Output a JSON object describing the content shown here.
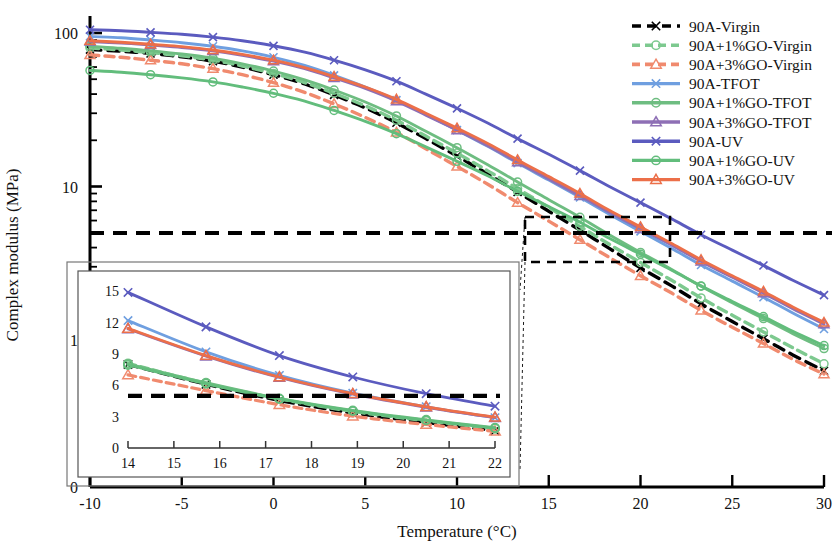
{
  "figure": {
    "title": "",
    "xlabel": "Temperature (°C)",
    "ylabel": "Complex modulus (MPa)"
  },
  "axes": {
    "x_ticks": [
      "-10",
      "-5",
      "0",
      "5",
      "10",
      "15",
      "20",
      "25",
      "30"
    ],
    "y_ticks": [
      "100",
      "10",
      "1",
      "0"
    ],
    "y_scale": "log",
    "x_range": [
      -10,
      30
    ],
    "y_range": [
      0.45,
      200
    ]
  },
  "reference_line": {
    "label": "5 MPa",
    "value": 5
  },
  "inset": {
    "x_ticks": [
      "14",
      "15",
      "16",
      "17",
      "18",
      "19",
      "20",
      "21",
      "22"
    ],
    "y_ticks": [
      "0",
      "3",
      "6",
      "9",
      "12",
      "15"
    ],
    "x_range": [
      14,
      22
    ],
    "y_range": [
      0,
      15.8
    ],
    "reference_value": 5
  },
  "legend": {
    "items": [
      {
        "label": "90A-Virgin",
        "color": "#000000",
        "dash": true,
        "marker": "x"
      },
      {
        "label": "90A+1%GO-Virgin",
        "color": "#7dc98f",
        "dash": true,
        "marker": "o"
      },
      {
        "label": "90A+3%GO-Virgin",
        "color": "#f08a6e",
        "dash": true,
        "marker": "t"
      },
      {
        "label": "90A-TFOT",
        "color": "#6f9fe0",
        "dash": false,
        "marker": "x"
      },
      {
        "label": "90A+1%GO-TFOT",
        "color": "#6ebd81",
        "dash": false,
        "marker": "o"
      },
      {
        "label": "90A+3%GO-TFOT",
        "color": "#8e6fb5",
        "dash": false,
        "marker": "t"
      },
      {
        "label": "90A-UV",
        "color": "#5b5bbf",
        "dash": false,
        "marker": "x"
      },
      {
        "label": "90A+1%GO-UV",
        "color": "#62bd7c",
        "dash": false,
        "marker": "o"
      },
      {
        "label": "90A+3%GO-UV",
        "color": "#ec6f49",
        "dash": false,
        "marker": "t"
      }
    ]
  },
  "chart_data": {
    "type": "line",
    "title": "",
    "xlabel": "Temperature (°C)",
    "ylabel": "Complex modulus (MPa)",
    "yscale": "log",
    "xlim": [
      -10,
      30
    ],
    "ylim": [
      0.45,
      200
    ],
    "grid": false,
    "legend_position": "top-right",
    "annotations": [
      {
        "text": "horizontal reference line at 5 MPa",
        "y": 5
      },
      {
        "text": "inset zoom of region 14-22 °C"
      }
    ],
    "x": [
      -10,
      -8.3,
      -6.7,
      -5,
      -3.3,
      -1.7,
      0,
      1.7,
      3.3,
      5,
      6.7,
      8.3,
      10,
      11.7,
      13.3,
      15,
      16.7,
      18.3,
      20,
      21.7,
      23.3,
      25,
      26.7,
      28.3,
      30
    ],
    "series": [
      {
        "name": "90A-Virgin",
        "color": "#000000",
        "style": "dashed",
        "marker": "x",
        "values": [
          78,
          76,
          73.5,
          70,
          65.5,
          60,
          53.5,
          46.5,
          39.5,
          32.5,
          26,
          20.5,
          15.8,
          12.0,
          9.2,
          6.9,
          5.2,
          3.95,
          2.95,
          2.25,
          1.72,
          1.32,
          1.02,
          0.8,
          0.63
        ]
      },
      {
        "name": "90A+1%GO-Virgin",
        "color": "#7dc98f",
        "style": "dashed",
        "marker": "o",
        "values": [
          80,
          77.5,
          74.5,
          71,
          66.5,
          61,
          54.5,
          47.5,
          40.5,
          33.5,
          27,
          21.3,
          16.5,
          12.6,
          9.7,
          7.3,
          5.5,
          4.2,
          3.2,
          2.45,
          1.88,
          1.45,
          1.13,
          0.89,
          0.7
        ]
      },
      {
        "name": "90A+3%GO-Virgin",
        "color": "#f08a6e",
        "style": "dashed",
        "marker": "t",
        "values": [
          72,
          69.5,
          66.5,
          63,
          58.5,
          53.5,
          47.5,
          41,
          34.5,
          28.2,
          22.5,
          17.6,
          13.5,
          10.3,
          7.85,
          5.95,
          4.5,
          3.45,
          2.62,
          2.02,
          1.56,
          1.21,
          0.95,
          0.75,
          0.6
        ]
      },
      {
        "name": "90A-TFOT",
        "color": "#6f9fe0",
        "style": "solid",
        "marker": "x",
        "values": [
          95,
          93,
          90,
          86.5,
          82,
          76.5,
          69.5,
          61.5,
          53,
          44.5,
          36.5,
          29.5,
          23.3,
          18.2,
          14.2,
          11.0,
          8.5,
          6.6,
          5.1,
          3.95,
          3.08,
          2.42,
          1.9,
          1.5,
          1.18
        ]
      },
      {
        "name": "90A+1%GO-TFOT",
        "color": "#6ebd81",
        "style": "solid",
        "marker": "o",
        "values": [
          82,
          79.5,
          76.5,
          73,
          68.5,
          63,
          56.5,
          49.5,
          42.5,
          35.5,
          28.8,
          22.9,
          17.9,
          13.8,
          10.7,
          8.2,
          6.3,
          4.85,
          3.72,
          2.88,
          2.24,
          1.75,
          1.38,
          1.1,
          0.88
        ]
      },
      {
        "name": "90A+3%GO-TFOT",
        "color": "#8e6fb5",
        "style": "solid",
        "marker": "t",
        "values": [
          88,
          86,
          83.5,
          80.5,
          76.5,
          71.5,
          65.5,
          58.5,
          51,
          43.5,
          36.0,
          29.2,
          23.3,
          18.4,
          14.4,
          11.2,
          8.7,
          6.8,
          5.3,
          4.15,
          3.25,
          2.56,
          2.02,
          1.6,
          1.27
        ]
      },
      {
        "name": "90A-UV",
        "color": "#5b5bbf",
        "style": "solid",
        "marker": "x",
        "values": [
          105,
          103.5,
          101,
          98,
          94,
          89,
          82.5,
          75,
          66.5,
          57.5,
          48.5,
          40.0,
          32.3,
          25.8,
          20.5,
          16.2,
          12.7,
          10.0,
          7.85,
          6.15,
          4.85,
          3.85,
          3.06,
          2.45,
          1.96
        ]
      },
      {
        "name": "90A+1%GO-UV",
        "color": "#62bd7c",
        "style": "solid",
        "marker": "o",
        "values": [
          57,
          55.5,
          53.5,
          51,
          48,
          44.5,
          40.5,
          36.0,
          31.3,
          26.6,
          22.1,
          18.1,
          14.6,
          11.7,
          9.3,
          7.4,
          5.85,
          4.6,
          3.62,
          2.85,
          2.25,
          1.78,
          1.42,
          1.14,
          0.92
        ]
      },
      {
        "name": "90A+3%GO-UV",
        "color": "#ec6f49",
        "style": "solid",
        "marker": "t",
        "values": [
          89,
          87,
          84.5,
          81.5,
          77.5,
          72.5,
          66.5,
          59.5,
          52,
          44.5,
          37.0,
          30.0,
          24.0,
          19.0,
          14.9,
          11.6,
          9.0,
          7.0,
          5.45,
          4.25,
          3.33,
          2.62,
          2.07,
          1.64,
          1.3
        ]
      }
    ],
    "inset_series": [
      {
        "name": "90A-Virgin",
        "x": [
          14,
          15.7,
          17.3,
          18.9,
          20.5,
          22
        ],
        "values": [
          8.0,
          6.1,
          4.55,
          3.35,
          2.45,
          1.65
        ]
      },
      {
        "name": "90A+1%GO-Virgin",
        "x": [
          14,
          15.7,
          17.3,
          18.9,
          20.5,
          22
        ],
        "values": [
          8.1,
          6.2,
          4.7,
          3.5,
          2.6,
          1.85
        ]
      },
      {
        "name": "90A+3%GO-Virgin",
        "x": [
          14,
          15.7,
          17.3,
          18.9,
          20.5,
          22
        ],
        "values": [
          7.0,
          5.5,
          4.15,
          3.05,
          2.25,
          1.6
        ]
      },
      {
        "name": "90A-TFOT",
        "x": [
          14,
          15.7,
          17.3,
          18.9,
          20.5,
          22
        ],
        "values": [
          12.2,
          9.2,
          6.95,
          5.25,
          3.95,
          2.9
        ]
      },
      {
        "name": "90A+1%GO-TFOT",
        "x": [
          14,
          15.7,
          17.3,
          18.9,
          20.5,
          22
        ],
        "values": [
          8.05,
          6.25,
          4.75,
          3.6,
          2.7,
          1.95
        ]
      },
      {
        "name": "90A+3%GO-TFOT",
        "x": [
          14,
          15.7,
          17.3,
          18.9,
          20.5,
          22
        ],
        "values": [
          11.4,
          8.8,
          6.75,
          5.15,
          3.9,
          2.9
        ]
      },
      {
        "name": "90A-UV",
        "x": [
          14,
          15.7,
          17.3,
          18.9,
          20.5,
          22
        ],
        "values": [
          14.9,
          11.6,
          8.85,
          6.8,
          5.2,
          4.0
        ]
      },
      {
        "name": "90A+1%GO-UV",
        "x": [
          14,
          15.7,
          17.3,
          18.9,
          20.5,
          22
        ],
        "values": [
          7.95,
          6.15,
          4.7,
          3.55,
          2.65,
          1.9
        ]
      },
      {
        "name": "90A+3%GO-UV",
        "x": [
          14,
          15.7,
          17.3,
          18.9,
          20.5,
          22
        ],
        "values": [
          11.45,
          8.85,
          6.8,
          5.2,
          3.95,
          2.95
        ]
      }
    ]
  }
}
